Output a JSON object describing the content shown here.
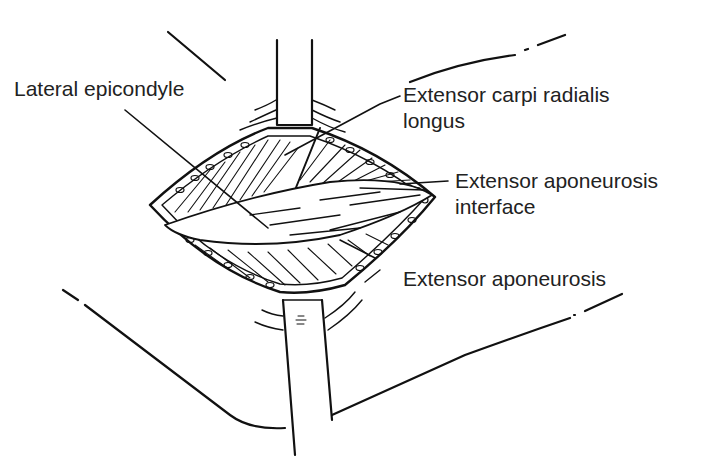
{
  "figure": {
    "style": "black line-art surgical illustration",
    "colors": {
      "ink": "#111111",
      "label_text": "#222222",
      "background": "#ffffff"
    },
    "labels": [
      {
        "id": "lateral-epicondyle",
        "lines": [
          "Lateral epicondyle"
        ]
      },
      {
        "id": "extensor-carpi-radialis-longus",
        "lines": [
          "Extensor carpi radialis",
          "longus"
        ]
      },
      {
        "id": "extensor-aponeurosis-interface",
        "lines": [
          "Extensor aponeurosis",
          "interface"
        ]
      },
      {
        "id": "extensor-aponeurosis",
        "lines": [
          "Extensor aponeurosis"
        ]
      }
    ]
  }
}
